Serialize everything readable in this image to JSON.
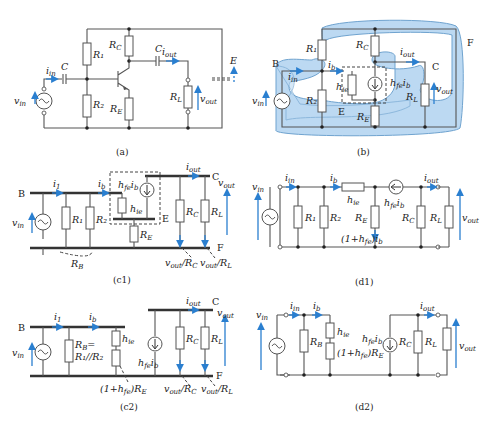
{
  "figure": {
    "panels": [
      {
        "id": "a",
        "caption": "(a)",
        "labels": {
          "r1": "R1",
          "r2": "R2",
          "rc": "RC",
          "re": "RE",
          "rl": "RL",
          "c_in": "C",
          "c_out": "C",
          "iin": "iin",
          "iout": "iout",
          "vin": "vin",
          "vout": "vout",
          "e": "E"
        }
      },
      {
        "id": "b",
        "caption": "(b)",
        "labels": {
          "b": "B",
          "c": "C",
          "e": "E",
          "f": "F",
          "r1": "R1",
          "r2": "R2",
          "rc": "RC",
          "re": "RE",
          "rl": "RL",
          "hie": "hie",
          "hfeib": "hfe ib",
          "iin": "iin",
          "ib": "ib",
          "iout": "iout",
          "vin": "vin",
          "vout": "vout"
        }
      },
      {
        "id": "c1",
        "caption": "(c1)",
        "labels": {
          "b": "B",
          "c": "C",
          "e": "E",
          "f": "F",
          "i1": "i1",
          "ib": "ib",
          "iout": "iout",
          "hfeib": "hfe ib",
          "hie": "hie",
          "r1": "R1",
          "r2": "R2",
          "rb": "RB",
          "re": "RE",
          "rc": "RC",
          "rl": "RL",
          "vin": "vin",
          "vout": "vout",
          "vout_rc": "vout/RC",
          "vout_rl": "vout/RL"
        }
      },
      {
        "id": "d1",
        "caption": "(d1)",
        "labels": {
          "vin": "vin",
          "iin": "iin",
          "ib": "ib",
          "hie": "hie",
          "iout": "iout",
          "r1": "R1",
          "r2": "R2",
          "re": "RE",
          "rc": "RC",
          "rl": "RL",
          "hfeib": "hfe ib",
          "ie": "(1+hfe)ib",
          "vout": "vout"
        }
      },
      {
        "id": "c2",
        "caption": "(c2)",
        "labels": {
          "b": "B",
          "c": "C",
          "f": "F",
          "i1": "i1",
          "ib": "ib",
          "iout": "iout",
          "rb1": "RB=",
          "rb2": "R1//R2",
          "hie": "hie",
          "hfeib": "hfe ib",
          "re_eq": "(1+hfe)RE",
          "rc": "RC",
          "rl": "RL",
          "vin": "vin",
          "vout": "vout",
          "vout_rc": "vout/RC",
          "vout_rl": "vout/RL"
        }
      },
      {
        "id": "d2",
        "caption": "(d2)",
        "labels": {
          "vin": "vin",
          "iin": "iin",
          "ib": "ib",
          "hie": "hie",
          "rb": "RB",
          "re_eq": "(1+hfe)RE",
          "hfeib": "hfe ib",
          "rc": "RC",
          "rl": "RL",
          "iout": "iout",
          "vout": "vout"
        }
      }
    ],
    "colors": {
      "wire": "#555555",
      "current_arrow": "#2a7fd0",
      "region_fill": "#bcd9f2"
    }
  }
}
